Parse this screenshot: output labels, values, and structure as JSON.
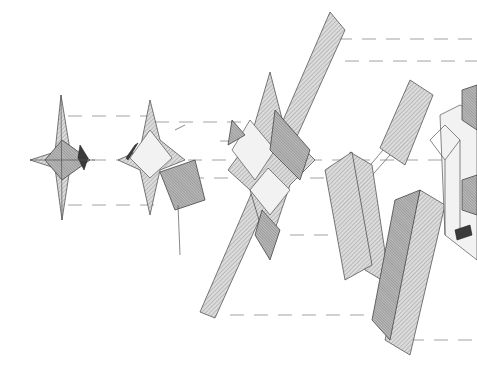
{
  "figure": {
    "type": "exploded axonometric architectural drawing",
    "background": "#ffffff",
    "line_color": "#555555",
    "components": [
      {
        "name": "small pavilion roof",
        "position": "left"
      },
      {
        "name": "pavilion roof with open frame",
        "position": "center-left"
      },
      {
        "name": "multi-eave pavilion with long corridor roof",
        "position": "center"
      },
      {
        "name": "L-shaped roof wings",
        "position": "center-right"
      },
      {
        "name": "building frame structure",
        "position": "right"
      }
    ],
    "text_labels": []
  }
}
